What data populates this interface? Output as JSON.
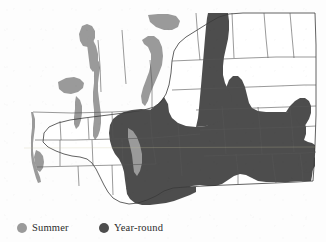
{
  "figure": {
    "type": "range-map",
    "region": "Washington State",
    "background_color": "#fdfdfd",
    "outline_color": "#3a3a3a",
    "county_line_color": "#555555"
  },
  "legend": {
    "position": "bottom-left",
    "items": [
      {
        "key": "summer",
        "label": "Summer",
        "color": "#9a9a9a",
        "marker": "filled-circle",
        "marker_icon": "circle-icon"
      },
      {
        "key": "yearround",
        "label": "Year-round",
        "color": "#4d4d4d",
        "marker": "filled-circle",
        "marker_icon": "circle-icon"
      }
    ]
  },
  "map": {
    "viewbox": "0 0 326 215",
    "state_outline_path": "M 43,142 L 44,131 L 52,125 L 66,121 L 84,118 L 104,116 L 122,114 L 139,112 L 152,109 L 160,104 L 166,96 L 170,86 L 172,74 L 173,62 L 175,52 L 180,44 L 188,38 L 196,33 L 203,28 L 210,23 L 218,18 L 226,15 L 236,14 L 250,14 L 268,14 L 288,14 L 305,14 L 315,14 L 316,40 L 316,70 L 316,100 L 316,130 L 315,152 L 314,168 L 313,180 L 300,181 L 280,182 L 258,183 L 236,184 L 214,185 L 196,186 L 182,187 L 172,188 L 165,190 L 158,194 L 150,198 L 142,201 L 134,203 L 126,203 L 118,201 L 112,197 L 108,192 L 104,186 L 100,179 L 96,172 L 92,166 L 88,161 L 84,158 L 78,156 L 72,155 L 66,154 L 60,152 L 54,149 L 48,146 Z",
    "summer_color": "#9a9a9a",
    "yearround_color": "#4d4d4d",
    "yearround_regions_note": "Large contiguous block across central, southeastern and northeastern-central Washington; plus a lobe extending north along the Okanogan/Chelan corridor to the Canadian border.",
    "summer_regions_note": "Narrow strips along the Pacific coast, Puget Sound shorelines, the San Juan/Whidbey island area, a patch in the interior Olympic Peninsula, and a band along the east slope of the Cascades."
  }
}
